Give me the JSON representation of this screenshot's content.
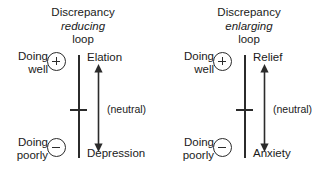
{
  "figure": {
    "background_color": "#ffffff",
    "ink_color": "#2b2b2b",
    "width": 332,
    "height": 173
  },
  "panels": [
    {
      "id": "discrepancy-reducing-loop",
      "title": {
        "line1": "Discrepancy",
        "line2": "reducing",
        "line2_style": "italic",
        "line3": "loop"
      },
      "left_axis": {
        "top_label_line1": "Doing",
        "top_label_line2": "well",
        "top_sign": "+",
        "bottom_label_line1": "Doing",
        "bottom_label_line2": "poorly",
        "bottom_sign": "−"
      },
      "right_axis": {
        "top_label": "Elation",
        "bottom_label": "Depression",
        "midpoint_label": "(neutral)"
      }
    },
    {
      "id": "discrepancy-enlarging-loop",
      "title": {
        "line1": "Discrepancy",
        "line2": "enlarging",
        "line2_style": "italic",
        "line3": "loop"
      },
      "left_axis": {
        "top_label_line1": "Doing",
        "top_label_line2": "well",
        "top_sign": "+",
        "bottom_label_line1": "Doing",
        "bottom_label_line2": "poorly",
        "bottom_sign": "−"
      },
      "right_axis": {
        "top_label": "Relief",
        "bottom_label": "Anxiety",
        "midpoint_label": "(neutral)"
      }
    }
  ]
}
